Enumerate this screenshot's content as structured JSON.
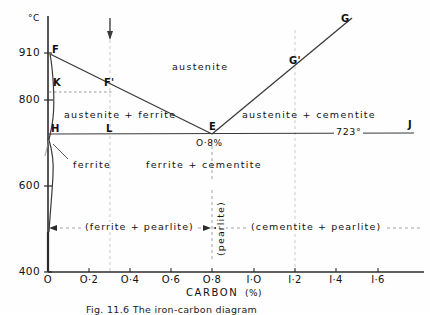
{
  "figure": {
    "caption": "Fig. 11.6  The iron-carbon diagram",
    "y_axis_unit": "°C",
    "x_axis_title": "CARBON",
    "x_axis_unit": "(%)"
  },
  "axes": {
    "y_ticks": [
      {
        "label": "910",
        "value": 910
      },
      {
        "label": "800",
        "value": 800
      },
      {
        "label": "600",
        "value": 600
      },
      {
        "label": "400",
        "value": 400
      }
    ],
    "x_ticks": [
      {
        "label": "O",
        "value": 0.0
      },
      {
        "label": "O·2",
        "value": 0.2
      },
      {
        "label": "O·4",
        "value": 0.4
      },
      {
        "label": "O·6",
        "value": 0.6
      },
      {
        "label": "O·8",
        "value": 0.8
      },
      {
        "label": "I·O",
        "value": 1.0
      },
      {
        "label": "I·2",
        "value": 1.2
      },
      {
        "label": "I·4",
        "value": 1.4
      },
      {
        "label": "I·6",
        "value": 1.6
      }
    ],
    "xlim": [
      0,
      1.75
    ],
    "ylim": [
      400,
      960
    ]
  },
  "points": [
    {
      "id": "F",
      "label": "F",
      "x": 0.0,
      "y": 910
    },
    {
      "id": "K",
      "label": "K",
      "x": 0.02,
      "y": 822
    },
    {
      "id": "Fp",
      "label": "F'",
      "x": 0.3,
      "y": 820
    },
    {
      "id": "H",
      "label": "H",
      "x": 0.03,
      "y": 723
    },
    {
      "id": "L",
      "label": "L",
      "x": 0.3,
      "y": 723
    },
    {
      "id": "E",
      "label": "E",
      "x": 0.8,
      "y": 723
    },
    {
      "id": "Gp",
      "label": "G'",
      "x": 1.2,
      "y": 880
    },
    {
      "id": "G",
      "label": "G",
      "x": 1.52,
      "y": 975
    },
    {
      "id": "J",
      "label": "J",
      "x": 1.73,
      "y": 723
    }
  ],
  "annotations": {
    "eutectoid_composition": "O·8%",
    "eutectoid_temperature": "723°",
    "regions": [
      {
        "name": "austenite",
        "label": "austenite"
      },
      {
        "name": "austenite-ferrite",
        "label": "austenite  +  ferrite"
      },
      {
        "name": "austenite-cementite",
        "label": "austenite  +  cementite"
      },
      {
        "name": "ferrite",
        "label": "ferrite"
      },
      {
        "name": "ferrite-cementite",
        "label": "ferrite    +    cementite"
      }
    ],
    "bands": [
      {
        "name": "ferrite-pearlite",
        "label": "(ferrite  +  pearlite)"
      },
      {
        "name": "pearlite",
        "label": "(pearlite)"
      },
      {
        "name": "cementite-pearlite",
        "label": "(cementite  +  pearlite)"
      }
    ]
  },
  "guides": [
    {
      "name": "guide-0-3",
      "value": 0.3,
      "has_arrow": true
    },
    {
      "name": "guide-1-2",
      "value": 1.2,
      "has_arrow": false
    }
  ],
  "colors": {
    "line": "#333333",
    "guide": "#c8c8c8",
    "text": "#111111",
    "background": "#fefefe"
  }
}
